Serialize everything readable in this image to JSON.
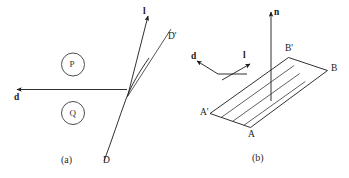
{
  "figure": {
    "panels": [
      {
        "id": "a",
        "caption": "(a)",
        "labels": {
          "vector_d": "d",
          "vector_l": "l",
          "curve_D": "D",
          "curve_D_prime": "D'",
          "node_P": "P",
          "node_Q": "Q"
        }
      },
      {
        "id": "b",
        "caption": "(b)",
        "labels": {
          "normal_n": "n",
          "vector_d": "d",
          "vector_l": "l",
          "vertex_A": "A",
          "vertex_A_prime": "A'",
          "vertex_B": "B",
          "vertex_B_prime": "B'"
        }
      }
    ],
    "colors": {
      "background": "#ffffff",
      "ink": "#1a1a1a",
      "ink_light": "#2b2b2b",
      "node_outline": "#3a3a3a"
    }
  }
}
